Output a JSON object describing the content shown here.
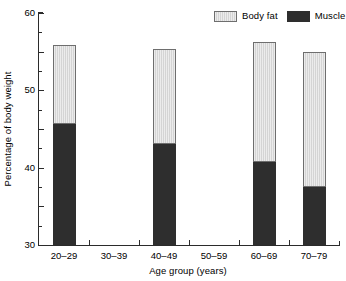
{
  "chart_data": {
    "type": "bar",
    "stacked": true,
    "title": "",
    "xlabel": "Age group (years)",
    "ylabel": "Percentage of body weight",
    "categories": [
      "20–29",
      "30–39",
      "40–49",
      "50–59",
      "60–69",
      "70–79"
    ],
    "series": [
      {
        "name": "Muscle",
        "color": "#2e2e2e",
        "values": [
          31.3,
          null,
          26.0,
          null,
          21.5,
          15.0
        ]
      },
      {
        "name": "Body fat",
        "color": "#d4d4d4",
        "values": [
          20.5,
          null,
          24.7,
          null,
          31.0,
          35.0
        ]
      }
    ],
    "totals": [
      51.8,
      null,
      50.7,
      null,
      52.5,
      50.0
    ],
    "ylim": [
      0,
      60
    ],
    "yticks": [
      0,
      10,
      20,
      30,
      40,
      50,
      60
    ],
    "ytick_labels": [
      "0",
      "10",
      "20",
      "30",
      "40",
      "50",
      "60"
    ],
    "yminor_ticks": [
      5,
      15,
      25,
      35,
      45,
      55
    ],
    "grid": false,
    "legend_position": "top-right",
    "legend_entries": [
      "Body fat",
      "Muscle"
    ],
    "missing_categories": [
      "30–39",
      "50–59"
    ]
  },
  "legend": {
    "entries": [
      {
        "label": "Body fat",
        "swatch": "light-gray-swatch"
      },
      {
        "label": "Muscle",
        "swatch": "dark-swatch"
      }
    ]
  },
  "axes": {
    "y_title": "Percentage of body weight",
    "x_title": "Age group (years)"
  }
}
